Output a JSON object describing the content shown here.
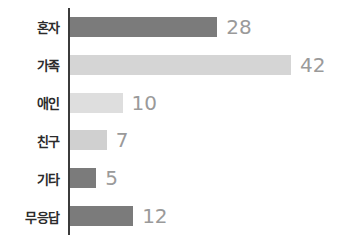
{
  "chart_data": {
    "type": "bar",
    "orientation": "horizontal",
    "title": "",
    "xlabel": "",
    "ylabel": "",
    "grid": false,
    "legend": "none",
    "xlim": [
      0,
      42
    ],
    "categories": [
      "혼자",
      "가족",
      "애인",
      "친구",
      "기타",
      "무응답"
    ],
    "values": [
      28,
      42,
      10,
      7,
      5,
      12
    ],
    "value_labels": [
      "28",
      "42",
      "10",
      "7",
      "5",
      "12"
    ],
    "bar_colors": [
      "#7b7b7b",
      "#d5d5d5",
      "#dedede",
      "#d0d0d0",
      "#7b7b7b",
      "#7b7b7b"
    ],
    "axis_color": "#3b3b3b",
    "value_label_color": "#9a9a9a",
    "category_label_color": "#2b2b2b",
    "background": "#ffffff"
  }
}
